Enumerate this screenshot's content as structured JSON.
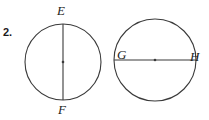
{
  "page": {
    "background": "#ffffff",
    "stroke_color": "#3a3a3a",
    "text_color": "#1b1b1b",
    "width": 209,
    "height": 120
  },
  "problem": {
    "number": "2."
  },
  "figures": [
    {
      "name": "left-circle",
      "shape": "circle",
      "center": {
        "x": 63,
        "y": 62
      },
      "radius": 38,
      "center_dot": true,
      "diameter": {
        "orientation": "vertical",
        "endpoints": [
          {
            "label": "E",
            "x": 63,
            "y": 24
          },
          {
            "label": "F",
            "x": 63,
            "y": 100
          }
        ]
      }
    },
    {
      "name": "right-circle",
      "shape": "circle",
      "center": {
        "x": 155,
        "y": 60
      },
      "radius": 41,
      "center_dot": true,
      "diameter": {
        "orientation": "horizontal",
        "endpoints": [
          {
            "label": "G",
            "x": 114,
            "y": 60
          },
          {
            "label": "H",
            "x": 196,
            "y": 60
          }
        ]
      }
    }
  ],
  "labels": {
    "E": "E",
    "F": "F",
    "G": "G",
    "H": "H"
  }
}
